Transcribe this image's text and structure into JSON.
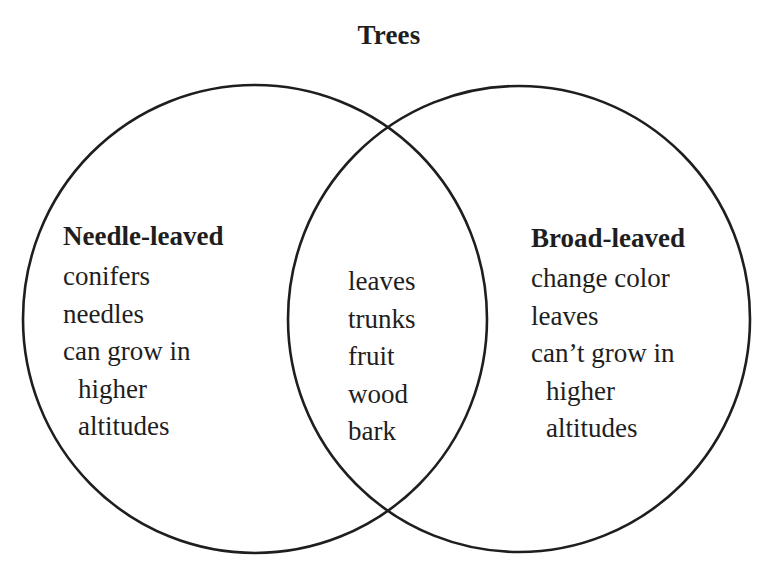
{
  "diagram": {
    "type": "venn",
    "title": "Trees",
    "stroke_color": "#1e1e1e",
    "background_color": "#ffffff",
    "sets": [
      {
        "name": "Needle-leaved",
        "items": [
          {
            "text": "conifers",
            "indent": false
          },
          {
            "text": "needles",
            "indent": false
          },
          {
            "text": "can grow in",
            "indent": false
          },
          {
            "text": "higher",
            "indent": true
          },
          {
            "text": "altitudes",
            "indent": true
          }
        ]
      },
      {
        "name": "Broad-leaved",
        "items": [
          {
            "text": "change color",
            "indent": false
          },
          {
            "text": "leaves",
            "indent": false
          },
          {
            "text": "can’t grow in",
            "indent": false
          },
          {
            "text": "higher",
            "indent": true
          },
          {
            "text": "altitudes",
            "indent": true
          }
        ]
      }
    ],
    "intersection": {
      "items": [
        "leaves",
        "trunks",
        "fruit",
        "wood",
        "bark"
      ]
    }
  }
}
